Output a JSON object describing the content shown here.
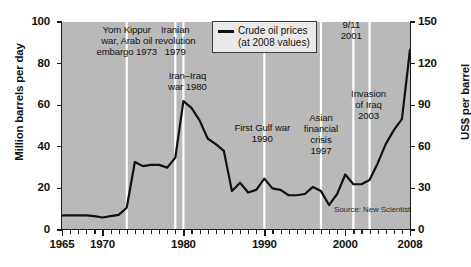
{
  "chart_data": {
    "type": "line",
    "title": "",
    "xlabel": "",
    "ylabel": "Million barrels per day",
    "ylabel_right": "US$ per barrel",
    "xlim": [
      1965,
      2008
    ],
    "ylim": [
      0,
      100
    ],
    "ylim_right": [
      0,
      150
    ],
    "grid": false,
    "legend_position": "top-center",
    "source": "Source: New Scientist",
    "xticks": [
      1965,
      1970,
      1980,
      1990,
      2000,
      2008
    ],
    "xtick_labels": [
      "1965",
      "1970",
      "1980",
      "1990",
      "2000",
      "2008"
    ],
    "yticks_left": [
      0,
      20,
      40,
      60,
      80,
      100
    ],
    "ytick_labels_left": [
      "0",
      "20",
      "40",
      "60",
      "80",
      "100"
    ],
    "yticks_right": [
      0,
      30,
      60,
      90,
      120,
      150
    ],
    "ytick_labels_right": [
      "0",
      "30",
      "60",
      "90",
      "120",
      "150"
    ],
    "series": [
      {
        "name": "Crude oil prices (at 2008 values)",
        "legend_label": "Crude oil prices\n(at 2008 values)",
        "units": "US$ per barrel (right axis)",
        "color": "#111111",
        "x": [
          1965,
          1966,
          1967,
          1968,
          1969,
          1970,
          1971,
          1972,
          1973,
          1974,
          1975,
          1976,
          1977,
          1978,
          1979,
          1980,
          1981,
          1982,
          1983,
          1984,
          1985,
          1986,
          1987,
          1988,
          1989,
          1990,
          1991,
          1992,
          1993,
          1994,
          1995,
          1996,
          1997,
          1998,
          1999,
          2000,
          2001,
          2002,
          2003,
          2004,
          2005,
          2006,
          2007,
          2008
        ],
        "values_right_axis": [
          11,
          11,
          11,
          11,
          10,
          9,
          10,
          11,
          16,
          49,
          46,
          47,
          47,
          45,
          52,
          93,
          88,
          79,
          66,
          62,
          57,
          28,
          34,
          27,
          29,
          37,
          30,
          29,
          25,
          25,
          26,
          31,
          28,
          18,
          26,
          40,
          33,
          33,
          36,
          48,
          62,
          72,
          80,
          130
        ],
        "values_left_axis_equiv": [
          7,
          7,
          7,
          7,
          6.7,
          6,
          6.7,
          7.3,
          10.7,
          32.7,
          30.7,
          31.3,
          31.3,
          30,
          34.7,
          62,
          58.7,
          52.7,
          44,
          41.3,
          38,
          18.7,
          22.7,
          18,
          19.3,
          24.7,
          20,
          19.3,
          16.7,
          16.7,
          17.3,
          20.7,
          18.7,
          12,
          17.3,
          26.7,
          22,
          22,
          24,
          32,
          41.3,
          48,
          53.3,
          86.7
        ]
      }
    ],
    "annotations": [
      {
        "label": "Yom Kippur\nwar, Arab oil\nembargo 1973",
        "year": 1973
      },
      {
        "label": "Iranian\nrevolution\n1979",
        "year": 1979
      },
      {
        "label": "Iran–Iraq\nwar 1980",
        "year": 1980
      },
      {
        "label": "First Gulf war\n1990",
        "year": 1990
      },
      {
        "label": "Asian\nfinancial\ncrisis\n1997",
        "year": 1997
      },
      {
        "label": "9/11\n2001",
        "year": 2001
      },
      {
        "label": "Invasion\nof Iraq\n2003",
        "year": 2003
      }
    ],
    "marker_line_color": "#ffffff",
    "plot_background": "#b9b9b9"
  }
}
